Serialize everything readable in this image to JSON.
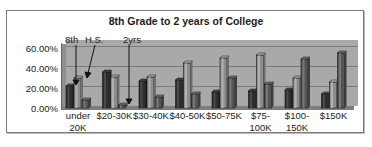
{
  "chart_data": {
    "type": "bar",
    "title": "8th Grade to 2 years of College",
    "xlabel": "",
    "ylabel": "",
    "ylim": [
      0,
      60
    ],
    "yticks": [
      "0.00%",
      "20.00%",
      "40.00%",
      "60.00%"
    ],
    "grid": true,
    "three_d": true,
    "legend": "annotations on first group",
    "categories": [
      "under 20K",
      "$20-30K",
      "$30-40K",
      "$40-50K",
      "$50-75K",
      "$75-100K",
      "$100-150K",
      "$150K"
    ],
    "series": [
      {
        "name": "8th",
        "color": "#3a3a3a",
        "values": [
          22,
          36,
          27,
          28,
          16,
          17,
          18,
          14
        ]
      },
      {
        "name": "H.S.",
        "color": "#8a8a8a",
        "values": [
          30,
          31,
          31,
          45,
          50,
          53,
          30,
          26
        ]
      },
      {
        "name": "2yrs",
        "color": "#5e5e5e",
        "values": [
          8,
          3,
          11,
          14,
          30,
          24,
          49,
          55
        ]
      }
    ],
    "annotations": [
      "8th",
      "H.S.",
      "2yrs"
    ]
  },
  "labels": {
    "title": "8th Grade to 2 years of College",
    "y0": "0.00%",
    "y20": "20.00%",
    "y40": "40.00%",
    "y60": "60.00%",
    "ann_8th": "8th",
    "ann_hs": "H.S.",
    "ann_2yrs": "2yrs",
    "x": [
      {
        "l1": "under",
        "l2": "20K"
      },
      {
        "l1": "$20-30K",
        "l2": ""
      },
      {
        "l1": "$30-40K",
        "l2": ""
      },
      {
        "l1": "$40-50K",
        "l2": ""
      },
      {
        "l1": "$50-75K",
        "l2": ""
      },
      {
        "l1": "$75-",
        "l2": "100K"
      },
      {
        "l1": "$100-",
        "l2": "150K"
      },
      {
        "l1": "$150K",
        "l2": ""
      }
    ]
  }
}
